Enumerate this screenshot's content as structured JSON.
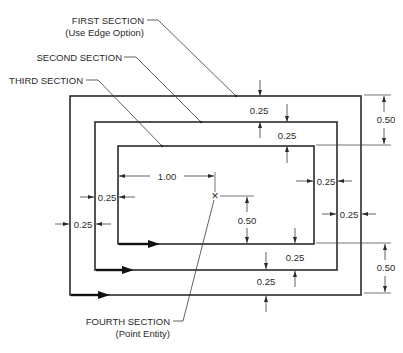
{
  "diagram": {
    "labels": {
      "first_section": "FIRST SECTION",
      "first_section_note": "(Use Edge Option)",
      "second_section": "SECOND SECTION",
      "third_section": "THIRD SECTION",
      "fourth_section": "FOURTH SECTION",
      "fourth_section_note": "(Point Entity)"
    },
    "dimensions": {
      "top_outer_gap": "0.25",
      "top_inner_gap": "0.25",
      "right_top_total": "0.50",
      "inner_width_to_point": "1.00",
      "left_inner_gap": "0.25",
      "left_outer_gap": "0.25",
      "right_inner_gap": "0.25",
      "right_outer_gap": "0.25",
      "point_height": "0.50",
      "bottom_inner_gap": "0.25",
      "bottom_outer_gap": "0.25",
      "right_bottom_total": "0.50"
    },
    "markers": {
      "point_symbol": "×"
    },
    "colors": {
      "line": "#2a2a2a",
      "background": "#ffffff"
    }
  }
}
